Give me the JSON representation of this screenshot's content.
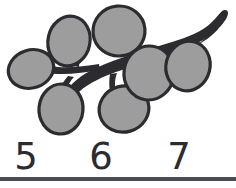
{
  "page": {
    "width": 236,
    "height": 188,
    "background_color": "#ffffff",
    "kind": "counting-worksheet-item"
  },
  "illustration": {
    "name": "berry-branch-drawing",
    "description": "Line drawing of a branch with seven oval berries",
    "berry_count": 7,
    "style": "black outline, flat gray fill",
    "colors": {
      "outline": "#2b2b30",
      "berry_fill": "#9d9d9d",
      "branch_fill": "#2b2b30",
      "background": "#ffffff"
    },
    "berries": [
      {
        "label": "berry-1",
        "cx": 31,
        "cy": 69,
        "rx": 23,
        "ry": 19,
        "rotation": -18
      },
      {
        "label": "berry-2",
        "cx": 69,
        "cy": 41,
        "rx": 21,
        "ry": 25,
        "rotation": 12
      },
      {
        "label": "berry-3",
        "cx": 119,
        "cy": 31,
        "rx": 26,
        "ry": 25,
        "rotation": -5
      },
      {
        "label": "berry-4",
        "cx": 61,
        "cy": 109,
        "rx": 22,
        "ry": 25,
        "rotation": 6
      },
      {
        "label": "berry-5",
        "cx": 124,
        "cy": 109,
        "rx": 25,
        "ry": 23,
        "rotation": -16
      },
      {
        "label": "berry-6",
        "cx": 149,
        "cy": 73,
        "rx": 25,
        "ry": 27,
        "rotation": 8
      },
      {
        "label": "berry-7",
        "cx": 188,
        "cy": 66,
        "rx": 22,
        "ry": 25,
        "rotation": 14
      }
    ]
  },
  "answers": {
    "name": "number-choices",
    "choices": [
      {
        "value": "5"
      },
      {
        "value": "6"
      },
      {
        "value": "7"
      }
    ]
  }
}
